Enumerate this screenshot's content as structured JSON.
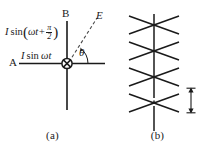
{
  "figure": {
    "background_color": "#ffffff",
    "line_color": "#1a1a1a"
  },
  "panel_a": {
    "caption": "(a)",
    "axis_b_label": "B",
    "axis_a_label": "A",
    "point_e_label": "E",
    "angle_label": "θ",
    "vertical_current": {
      "prefix": "I",
      "function": "sin",
      "open_paren": "(",
      "argument": "ωt+",
      "fraction_numerator": "π",
      "fraction_denominator": "2",
      "close_paren": ")",
      "plain_text": "I sin(ωt + π/2)"
    },
    "horizontal_current": {
      "prefix": "I",
      "function": "sin",
      "argument": "ωt",
      "plain_text": "I sin ωt"
    },
    "feed_point_icon": "crossed-circle-icon"
  },
  "panel_b": {
    "caption": "(b)",
    "spacing_label": "d",
    "element_count": 4,
    "spacing_arrow_icon": "double-headed-vertical-arrow-icon"
  }
}
